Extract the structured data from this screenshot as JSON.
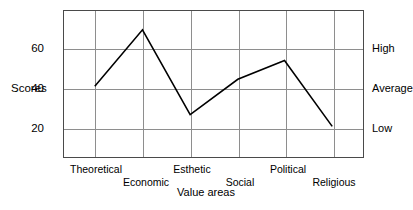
{
  "chart_data": {
    "type": "line",
    "title": "",
    "subtitle": "",
    "xlabel": "Value areas",
    "ylabel": "Scores",
    "categories": [
      "Theoretical",
      "Economic",
      "Esthetic",
      "Social",
      "Political",
      "Religious"
    ],
    "values": [
      40,
      64,
      28,
      43,
      51,
      23
    ],
    "series": [
      {
        "name": "Scores",
        "values": [
          40,
          64,
          28,
          43,
          51,
          23
        ]
      }
    ],
    "ylim": [
      10,
      72
    ],
    "yticks": [
      20,
      40,
      60
    ],
    "ytick_labels": [
      "20",
      "40",
      "60"
    ],
    "secondary_axis": {
      "position": "right",
      "ticks": [
        20,
        40,
        60
      ],
      "labels": [
        "Low",
        "Average",
        "High"
      ]
    },
    "grid": true,
    "grid_color": "#8e8e8e",
    "line_color": "#000000",
    "frame_color": "#4a4a4a",
    "legend": "none",
    "markers": false
  },
  "axes": {
    "y_title": "Scores",
    "x_title": "Value areas",
    "y_left_ticks": [
      {
        "label": "60",
        "value": 60
      },
      {
        "label": "40",
        "value": 40
      },
      {
        "label": "20",
        "value": 20
      }
    ],
    "y_right_ticks": [
      {
        "label": "High",
        "value": 60
      },
      {
        "label": "Average",
        "value": 40
      },
      {
        "label": "Low",
        "value": 20
      }
    ],
    "x_ticks": [
      {
        "label": "Theoretical",
        "value": 40,
        "row": 0
      },
      {
        "label": "Economic",
        "value": 64,
        "row": 1
      },
      {
        "label": "Esthetic",
        "value": 28,
        "row": 0
      },
      {
        "label": "Social",
        "value": 43,
        "row": 1
      },
      {
        "label": "Political",
        "value": 51,
        "row": 0
      },
      {
        "label": "Religious",
        "value": 23,
        "row": 1
      }
    ]
  }
}
